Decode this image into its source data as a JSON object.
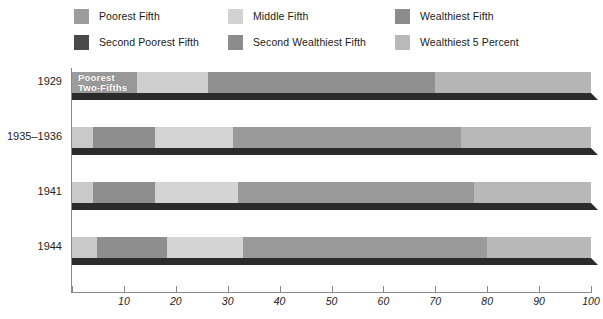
{
  "legend": {
    "items": [
      {
        "label": "Poorest Fifth",
        "color": "#9c9c9c",
        "col": 0,
        "row": 0
      },
      {
        "label": "Middle Fifth",
        "color": "#d2d2d2",
        "col": 1,
        "row": 0
      },
      {
        "label": "Wealthiest Fifth",
        "color": "#8c8c8c",
        "col": 2,
        "row": 0
      },
      {
        "label": "Second Poorest Fifth",
        "color": "#4a4a4a",
        "col": 0,
        "row": 1
      },
      {
        "label": "Second Wealthiest Fifth",
        "color": "#8c8c8c",
        "col": 1,
        "row": 1
      },
      {
        "label": "Wealthiest 5 Percent",
        "color": "#b9b9b9",
        "col": 2,
        "row": 1
      }
    ]
  },
  "axis": {
    "xlabel": "",
    "ylabel": "",
    "xmin": 0,
    "xmax": 100,
    "ticks": [
      0,
      10,
      20,
      30,
      40,
      50,
      60,
      70,
      80,
      90,
      100
    ],
    "tick_labels": [
      "",
      "10",
      "20",
      "30",
      "40",
      "50",
      "60",
      "70",
      "80",
      "90",
      "100"
    ]
  },
  "annotations": {
    "poorest_two_fifths": "Poorest\nTwo-Fifths"
  },
  "chart_data": {
    "type": "bar",
    "orientation": "horizontal",
    "stacked": true,
    "title": "",
    "subtitle": "",
    "xlabel": "",
    "ylabel": "",
    "xlim": [
      0,
      100
    ],
    "grid": false,
    "legend_position": "top",
    "categories": [
      "1929",
      "1935–1936",
      "1941",
      "1944"
    ],
    "series": [
      {
        "name": "Poorest Fifth",
        "color": "#9c9c9c",
        "values": [
          3.5,
          4.1,
          4.1,
          4.9
        ]
      },
      {
        "name": "Second Poorest Fifth",
        "color": "#7d7d7d",
        "values": [
          9.0,
          9.2,
          9.5,
          10.9
        ]
      },
      {
        "name": "Middle Fifth",
        "color": "#d2d2d2",
        "values": [
          13.8,
          14.1,
          15.3,
          16.2
        ]
      },
      {
        "name": "Second Wealthiest Fifth",
        "color": "#8c8c8c",
        "values": [
          19.3,
          20.9,
          22.3,
          22.2
        ]
      },
      {
        "name": "Wealthiest Fifth",
        "color": "#9c9c9c",
        "values": [
          54.4,
          51.7,
          48.8,
          45.8
        ]
      }
    ],
    "cumulative_boundaries": [
      {
        "category": "1929",
        "boundaries": [
          0,
          3.5,
          12.5,
          26.3,
          45.6,
          100.0
        ]
      },
      {
        "category": "1935–1936",
        "boundaries": [
          0,
          4.1,
          13.3,
          27.4,
          48.3,
          100.0
        ]
      },
      {
        "category": "1941",
        "boundaries": [
          0,
          4.1,
          13.6,
          28.9,
          51.2,
          100.0
        ]
      },
      {
        "category": "1944",
        "boundaries": [
          0,
          4.9,
          15.8,
          32.0,
          54.2,
          100.0
        ]
      }
    ],
    "rows": [
      {
        "label": "1929",
        "note": "Poorest\nTwo-Fifths",
        "segments": [
          {
            "name": "Poorest Fifth",
            "start": 0.0,
            "end": 3.5,
            "color": "#9c9c9c"
          },
          {
            "name": "Second Poorest Fifth",
            "start": 3.5,
            "end": 12.5,
            "color": "#989898"
          },
          {
            "name": "Middle Fifth",
            "start": 12.5,
            "end": 26.3,
            "color": "#cfcfcf"
          },
          {
            "name": "Second Wealthiest Fifth",
            "start": 26.3,
            "end": 70.0,
            "color": "#8f8f8f"
          },
          {
            "name": "Wealthiest Fifth",
            "start": 70.0,
            "end": 100.0,
            "color": "#b5b5b5"
          }
        ]
      },
      {
        "label": "1935–1936",
        "note": "",
        "segments": [
          {
            "name": "Poorest Fifth",
            "start": 0.0,
            "end": 4.1,
            "color": "#c9c9c9"
          },
          {
            "name": "Second Poorest Fifth",
            "start": 4.1,
            "end": 16.0,
            "color": "#8e8e8e"
          },
          {
            "name": "Middle Fifth",
            "start": 16.0,
            "end": 31.0,
            "color": "#d4d4d4"
          },
          {
            "name": "Second Wealthiest Fifth",
            "start": 31.0,
            "end": 75.0,
            "color": "#9a9a9a"
          },
          {
            "name": "Wealthiest Fifth",
            "start": 75.0,
            "end": 100.0,
            "color": "#b8b8b8"
          }
        ]
      },
      {
        "label": "1941",
        "note": "",
        "segments": [
          {
            "name": "Poorest Fifth",
            "start": 0.0,
            "end": 4.1,
            "color": "#c9c9c9"
          },
          {
            "name": "Second Poorest Fifth",
            "start": 4.1,
            "end": 16.0,
            "color": "#8e8e8e"
          },
          {
            "name": "Middle Fifth",
            "start": 16.0,
            "end": 32.0,
            "color": "#d4d4d4"
          },
          {
            "name": "Second Wealthiest Fifth",
            "start": 32.0,
            "end": 77.5,
            "color": "#9a9a9a"
          },
          {
            "name": "Wealthiest Fifth",
            "start": 77.5,
            "end": 100.0,
            "color": "#b8b8b8"
          }
        ]
      },
      {
        "label": "1944",
        "note": "",
        "segments": [
          {
            "name": "Poorest Fifth",
            "start": 0.0,
            "end": 4.9,
            "color": "#c9c9c9"
          },
          {
            "name": "Second Poorest Fifth",
            "start": 4.9,
            "end": 18.3,
            "color": "#8e8e8e"
          },
          {
            "name": "Middle Fifth",
            "start": 18.3,
            "end": 33.0,
            "color": "#d4d4d4"
          },
          {
            "name": "Second Wealthiest Fifth",
            "start": 33.0,
            "end": 80.0,
            "color": "#9a9a9a"
          },
          {
            "name": "Wealthiest Fifth",
            "start": 80.0,
            "end": 100.0,
            "color": "#b8b8b8"
          }
        ]
      }
    ]
  }
}
